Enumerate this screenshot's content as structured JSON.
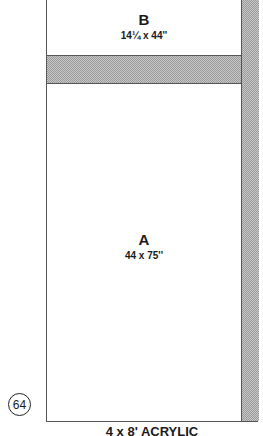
{
  "diagram": {
    "panels": [
      {
        "label": "B",
        "dimensions": "14¼ x 44''"
      },
      {
        "label": "A",
        "dimensions": "44 x 75''"
      }
    ],
    "figure_number": "64",
    "caption": "4 x 8' ACRYLIC",
    "colors": {
      "line": "#555555",
      "shade": "#b0b0b0",
      "text": "#1a1a1a"
    }
  }
}
